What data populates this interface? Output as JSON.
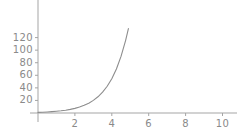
{
  "chart_data": {
    "type": "line",
    "title": "",
    "subtitle": "",
    "xlabel": "",
    "ylabel": "",
    "xlim": [
      0,
      10.6
    ],
    "ylim": [
      0,
      132
    ],
    "grid": false,
    "legend": null,
    "axis_color": "#9a9a9a",
    "curve_color": "#8d8d8d",
    "background_color": "#ffffff",
    "x_ticks": [
      {
        "value": 2,
        "label": "2"
      },
      {
        "value": 4,
        "label": "4"
      },
      {
        "value": 6,
        "label": "6"
      },
      {
        "value": 8,
        "label": "8"
      },
      {
        "value": 10,
        "label": "10"
      }
    ],
    "y_ticks": [
      {
        "value": 20,
        "label": "20"
      },
      {
        "value": 40,
        "label": "40"
      },
      {
        "value": 60,
        "label": "60"
      },
      {
        "value": 80,
        "label": "80"
      },
      {
        "value": 100,
        "label": "100"
      },
      {
        "value": 120,
        "label": "120"
      }
    ],
    "series": [
      {
        "name": "exp",
        "x": [
          0,
          0.25,
          0.5,
          0.75,
          1,
          1.25,
          1.5,
          1.75,
          2,
          2.25,
          2.5,
          2.75,
          3,
          3.25,
          3.5,
          3.75,
          4,
          4.25,
          4.5,
          4.75,
          4.9
        ],
        "values": [
          1,
          1.28,
          1.65,
          2.12,
          2.72,
          3.49,
          4.48,
          5.75,
          7.39,
          9.49,
          12.18,
          15.64,
          20.09,
          25.79,
          33.12,
          42.52,
          54.6,
          70.11,
          90.02,
          115.58,
          134.29
        ]
      }
    ]
  }
}
